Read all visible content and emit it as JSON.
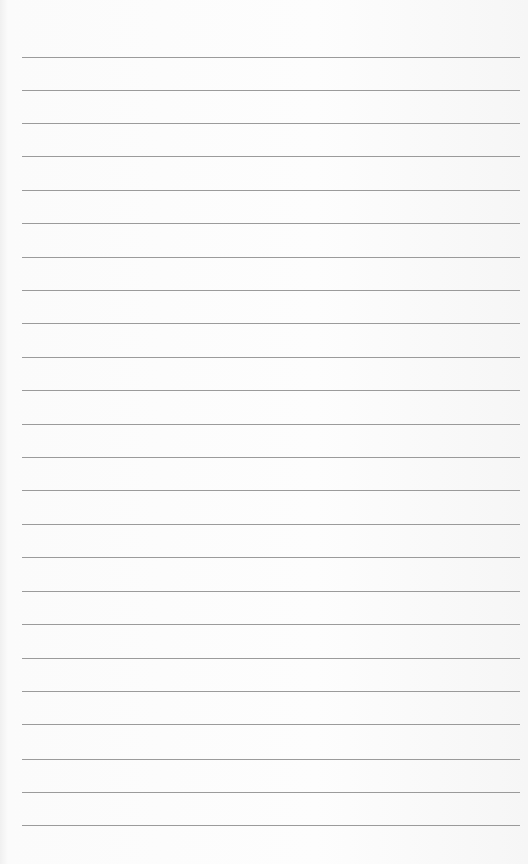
{
  "paper": {
    "type": "lined-paper",
    "line_count": 24,
    "line_color": "#8a8a8a",
    "background": "#fafafa",
    "line_positions": [
      57,
      90,
      123,
      156,
      190,
      223,
      257,
      290,
      323,
      357,
      390,
      424,
      457,
      490,
      524,
      557,
      591,
      624,
      658,
      691,
      724,
      759,
      792,
      825
    ]
  }
}
